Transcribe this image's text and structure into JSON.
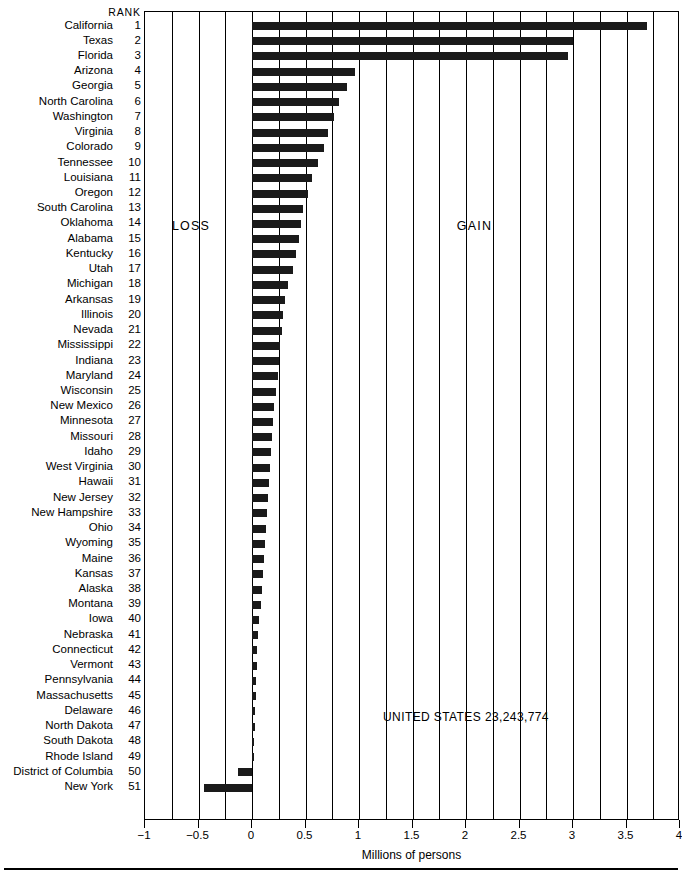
{
  "rank_header": "RANK",
  "annotations": {
    "loss": "LOSS",
    "gain": "GAIN",
    "us_total": "UNITED STATES 23,243,774"
  },
  "axis": {
    "title": "Millions of persons",
    "tick_labels": [
      "−1",
      "−0.5",
      "0",
      "0.5",
      "1",
      "1.5",
      "2",
      "2.5",
      "3",
      "3.5",
      "4"
    ],
    "tick_values": [
      -1,
      -0.5,
      0,
      0.5,
      1,
      1.5,
      2,
      2.5,
      3,
      3.5,
      4
    ],
    "minor_step": 0.25,
    "xlim": [
      -1,
      4
    ]
  },
  "chart_data": {
    "type": "bar",
    "orientation": "horizontal",
    "title": "",
    "xlabel": "Millions of persons",
    "ylabel": "",
    "xlim": [
      -1,
      4
    ],
    "grid": true,
    "legend": false,
    "categories": [
      "California",
      "Texas",
      "Florida",
      "Arizona",
      "Georgia",
      "North Carolina",
      "Washington",
      "Virginia",
      "Colorado",
      "Tennessee",
      "Louisiana",
      "Oregon",
      "South Carolina",
      "Oklahoma",
      "Alabama",
      "Kentucky",
      "Utah",
      "Michigan",
      "Arkansas",
      "Illinois",
      "Nevada",
      "Mississippi",
      "Indiana",
      "Maryland",
      "Wisconsin",
      "New Mexico",
      "Minnesota",
      "Missouri",
      "Idaho",
      "West Virginia",
      "Hawaii",
      "New Jersey",
      "New Hampshire",
      "Ohio",
      "Wyoming",
      "Maine",
      "Kansas",
      "Alaska",
      "Montana",
      "Iowa",
      "Nebraska",
      "Connecticut",
      "Vermont",
      "Pennsylvania",
      "Massachusetts",
      "Delaware",
      "North Dakota",
      "South Dakota",
      "Rhode Island",
      "District of Columbia",
      "New York"
    ],
    "ranks": [
      1,
      2,
      3,
      4,
      5,
      6,
      7,
      8,
      9,
      10,
      11,
      12,
      13,
      14,
      15,
      16,
      17,
      18,
      19,
      20,
      21,
      22,
      23,
      24,
      25,
      26,
      27,
      28,
      29,
      30,
      31,
      32,
      33,
      34,
      35,
      36,
      37,
      38,
      39,
      40,
      41,
      42,
      43,
      44,
      45,
      46,
      47,
      48,
      49,
      50,
      51
    ],
    "values": [
      3.69,
      3.0,
      2.95,
      0.96,
      0.89,
      0.81,
      0.77,
      0.71,
      0.67,
      0.62,
      0.56,
      0.52,
      0.48,
      0.46,
      0.44,
      0.41,
      0.38,
      0.34,
      0.31,
      0.29,
      0.28,
      0.26,
      0.25,
      0.24,
      0.22,
      0.21,
      0.2,
      0.19,
      0.18,
      0.17,
      0.16,
      0.15,
      0.14,
      0.13,
      0.12,
      0.11,
      0.1,
      0.09,
      0.08,
      0.07,
      0.06,
      0.05,
      0.045,
      0.04,
      0.035,
      0.03,
      0.025,
      0.02,
      0.015,
      -0.13,
      -0.45
    ]
  }
}
